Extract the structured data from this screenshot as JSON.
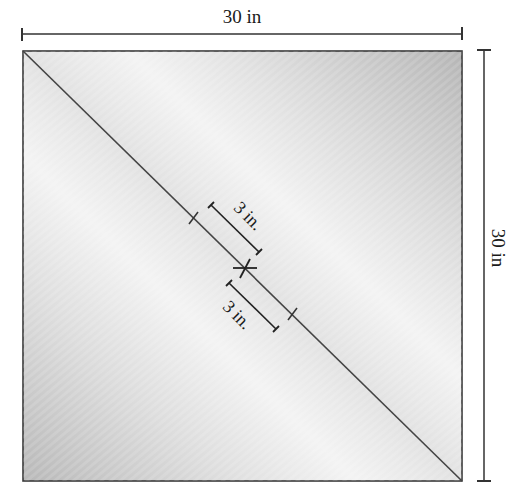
{
  "diagram": {
    "width_label": "30 in",
    "height_label": "30 in",
    "offset_label_upper": "3 in.",
    "offset_label_lower": "3 in.",
    "colors": {
      "stroke": "#333333",
      "fill_dark": "#b9b9b9",
      "fill_light": "#f4f4f4"
    }
  }
}
